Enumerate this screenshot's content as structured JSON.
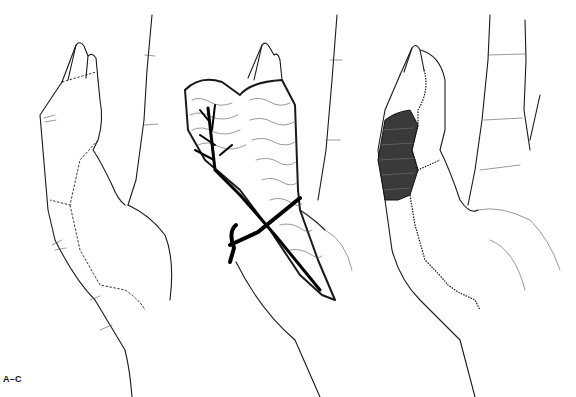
{
  "figure": {
    "label": "A–C",
    "panels": [
      {
        "id": "A",
        "description": "Hand with dashed incision lines outlining flap on thumb and thenar region"
      },
      {
        "id": "B",
        "description": "Raised flap with vascular pedicle and vessel loop"
      },
      {
        "id": "C",
        "description": "Flap inset with sutures; shaded donor region on thumb"
      }
    ]
  }
}
